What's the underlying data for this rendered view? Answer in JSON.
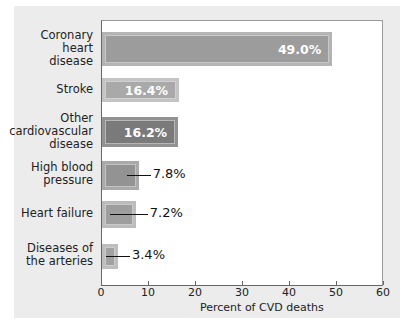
{
  "chart_data": {
    "type": "bar",
    "orientation": "horizontal",
    "title": "",
    "xlabel": "Percent of CVD deaths",
    "ylabel": "",
    "xlim": [
      0,
      60
    ],
    "xticks": [
      "0",
      "10",
      "20",
      "30",
      "40",
      "50",
      "60"
    ],
    "categories": [
      "Coronary heart disease",
      "Stroke",
      "Other cardiovascular disease",
      "High blood pressure",
      "Heart failure",
      "Diseases of the arteries"
    ],
    "values": [
      49.0,
      16.4,
      16.2,
      7.8,
      7.2,
      3.4
    ],
    "value_labels": [
      "49.0%",
      "16.4%",
      "16.2%",
      "7.8%",
      "7.2%",
      "3.4%"
    ],
    "grid": false,
    "legend": null
  },
  "bars": [
    {
      "label_lines": [
        "Coronary",
        "heart",
        "disease"
      ],
      "value": 49.0,
      "text": "49.0%",
      "fill": "#9c9c9c",
      "border": "#b4b4b4",
      "label_inside": true
    },
    {
      "label_lines": [
        "Stroke"
      ],
      "value": 16.4,
      "text": "16.4%",
      "fill": "#a9a9a9",
      "border": "#c4c4c4",
      "label_inside": true
    },
    {
      "label_lines": [
        "Other",
        "cardiovascular",
        "disease"
      ],
      "value": 16.2,
      "text": "16.2%",
      "fill": "#7a7a7a",
      "border": "#929292",
      "label_inside": true
    },
    {
      "label_lines": [
        "High blood",
        "pressure"
      ],
      "value": 7.8,
      "text": "7.8%",
      "fill": "#939393",
      "border": "#aaaaaa",
      "label_inside": false
    },
    {
      "label_lines": [
        "Heart failure"
      ],
      "value": 7.2,
      "text": "7.2%",
      "fill": "#9e9e9e",
      "border": "#bcbcbc",
      "label_inside": false
    },
    {
      "label_lines": [
        "Diseases of",
        "the arteries"
      ],
      "value": 3.4,
      "text": "3.4%",
      "fill": "#a2a2a2",
      "border": "#bebebe",
      "label_inside": false
    }
  ]
}
